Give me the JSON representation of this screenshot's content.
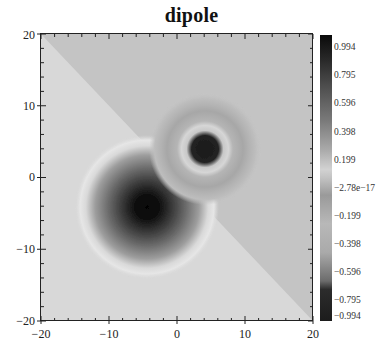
{
  "chart_data": {
    "type": "heatmap",
    "title": "dipole",
    "xlabel": "",
    "ylabel": "",
    "xlim": [
      -20,
      20
    ],
    "ylim": [
      -20,
      20
    ],
    "x_ticks": [
      -20,
      -10,
      0,
      10,
      20
    ],
    "y_ticks": [
      -20,
      -10,
      0,
      10,
      20
    ],
    "x_tick_labels": [
      "−20",
      "−10",
      "0",
      "10",
      "20"
    ],
    "y_tick_labels": [
      "20",
      "10",
      "0",
      "−10",
      "−20"
    ],
    "minor_tick_step": 2,
    "grid": false,
    "colorbar": {
      "position": "right",
      "min": -0.994,
      "max": 0.994,
      "tick_labels": [
        "0.994",
        "0.795",
        "0.596",
        "0.398",
        "0.199",
        "−2.78e−17",
        "−0.199",
        "−0.398",
        "−0.596",
        "−0.795",
        "−0.994"
      ],
      "tick_values": [
        0.994,
        0.795,
        0.596,
        0.398,
        0.199,
        -2.78e-17,
        -0.199,
        -0.398,
        -0.596,
        -0.795,
        -0.994
      ],
      "colormap": "gray-banded"
    },
    "features": [
      {
        "name": "positive-pole",
        "center": [
          4.5,
          4
        ],
        "peak_value": 0.994,
        "shape": "sharp core with concentric rings"
      },
      {
        "name": "negative-pole",
        "center": [
          -4.5,
          -4.5
        ],
        "peak_value": -0.994,
        "shape": "broad smooth well"
      }
    ],
    "background": {
      "upper_right_half_value": 0.02,
      "lower_left_half_value": -0.02,
      "divider": "diagonal line y = -x"
    }
  }
}
